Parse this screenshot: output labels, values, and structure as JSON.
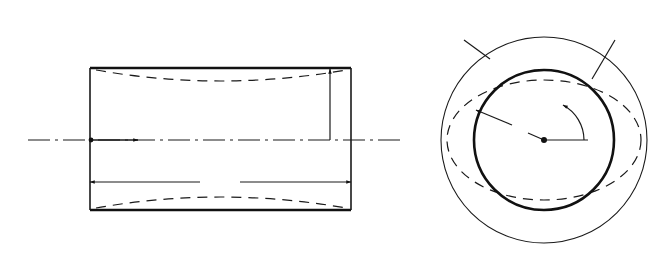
{
  "figure": {
    "colors": {
      "ink": "#1a1a1a",
      "background": "#ffffff"
    }
  },
  "side_view": {
    "labels": {
      "top_pressure": "p",
      "left_axial_load": "q",
      "right_axial_load": "q",
      "radius": "R",
      "axis": "x",
      "length": "l"
    },
    "geometry": {
      "shell_left": 90,
      "shell_right": 351,
      "shell_top": 68,
      "shell_bottom": 210,
      "load_top": 37,
      "load_bottom": 243,
      "q_left": 53,
      "q_right": 387,
      "centerline_y": 140
    },
    "pressure_arrow_x": [
      90,
      115,
      142,
      168,
      194,
      221,
      247,
      273,
      299,
      325,
      351
    ],
    "axial_arrow_y": [
      72,
      78,
      84,
      93,
      107,
      124,
      140,
      157,
      174,
      188,
      197,
      204,
      208
    ]
  },
  "cross_section": {
    "labels": {
      "pressure": "p",
      "axial_load": "q",
      "radius": "R",
      "angle": "φ"
    },
    "geometry": {
      "cx": 544,
      "cy": 140,
      "r_inner": 70,
      "r_outer": 103,
      "ellipse_rx": 97,
      "ellipse_ry": 60
    },
    "arrow_count": 24,
    "node_marker_angles_deg": [
      100,
      70,
      35,
      8,
      -22,
      -50,
      -80,
      -115,
      -150,
      -185,
      -210,
      -240
    ]
  }
}
